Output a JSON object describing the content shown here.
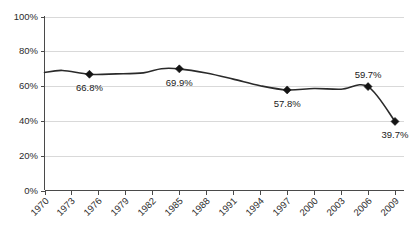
{
  "chart_data": {
    "type": "line",
    "title": "",
    "subtitle": "",
    "xlabel": "",
    "ylabel": "",
    "grid": true,
    "legend": "none",
    "xlim": [
      1970,
      2010
    ],
    "ylim": [
      0,
      100
    ],
    "y_ticks": [
      "0%",
      "20%",
      "40%",
      "60%",
      "80%",
      "100%"
    ],
    "y_tick_values": [
      0,
      20,
      40,
      60,
      80,
      100
    ],
    "x_ticks": [
      "1970",
      "1973",
      "1976",
      "1979",
      "1982",
      "1985",
      "1988",
      "1991",
      "1994",
      "1997",
      "2000",
      "2003",
      "2006",
      "2009"
    ],
    "x_tick_values": [
      1970,
      1973,
      1976,
      1979,
      1982,
      1985,
      1988,
      1991,
      1994,
      1997,
      2000,
      2003,
      2006,
      2009
    ],
    "x": [
      1970,
      1972,
      1975,
      1978,
      1981,
      1983,
      1985,
      1988,
      1991,
      1994,
      1997,
      2000,
      2003,
      2006,
      2009
    ],
    "values": [
      67.8,
      69.0,
      66.8,
      67.0,
      67.6,
      70.0,
      69.9,
      67.5,
      64.0,
      60.2,
      57.8,
      58.6,
      58.2,
      59.7,
      39.7
    ],
    "series": [
      {
        "name": "series-1",
        "color": "#2a2a2a",
        "values": [
          67.8,
          69.0,
          66.8,
          67.0,
          67.6,
          70.0,
          69.9,
          67.5,
          64.0,
          60.2,
          57.8,
          58.6,
          58.2,
          59.7,
          39.7
        ]
      }
    ],
    "annotations": [
      {
        "label": "66.8%",
        "x": 1975,
        "y": 66.8,
        "position": "below"
      },
      {
        "label": "69.9%",
        "x": 1985,
        "y": 69.9,
        "position": "below"
      },
      {
        "label": "57.8%",
        "x": 1997,
        "y": 57.8,
        "position": "below"
      },
      {
        "label": "59.7%",
        "x": 2006,
        "y": 59.7,
        "position": "above"
      },
      {
        "label": "39.7%",
        "x": 2009,
        "y": 39.7,
        "position": "below"
      }
    ],
    "markers": [
      {
        "x": 1975,
        "y": 66.8
      },
      {
        "x": 1985,
        "y": 69.9
      },
      {
        "x": 1997,
        "y": 57.8
      },
      {
        "x": 2006,
        "y": 59.7
      },
      {
        "x": 2009,
        "y": 39.7
      }
    ],
    "colors": {
      "line": "#2a2a2a",
      "marker": "#141414",
      "grid": "#d9d9d9",
      "axis": "#4a4a4a",
      "text": "#2b2b2b",
      "background": "#ffffff"
    }
  }
}
